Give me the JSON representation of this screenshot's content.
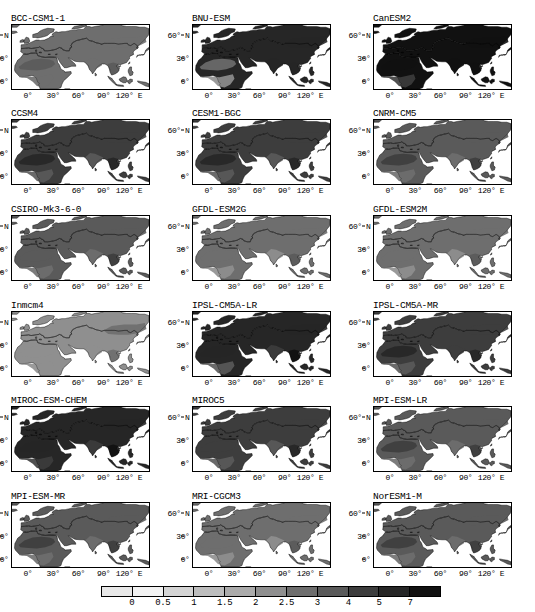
{
  "figure": {
    "type": "map-grid",
    "rows": 6,
    "cols": 3,
    "projection": "cylindrical-equidistant",
    "region": "Africa-Eurasia",
    "lon_range": [
      -20,
      145
    ],
    "lat_range": [
      -12,
      75
    ]
  },
  "axes": {
    "xticks": [
      {
        "label": "0°",
        "value": 0
      },
      {
        "label": "30°",
        "value": 30
      },
      {
        "label": "60°",
        "value": 60
      },
      {
        "label": "90°",
        "value": 90
      },
      {
        "label": "120° E",
        "value": 120
      }
    ],
    "yticks": [
      {
        "label": "60° N",
        "value": 60
      },
      {
        "label": "30°",
        "value": 30
      },
      {
        "label": "0°",
        "value": 0
      }
    ]
  },
  "colorbar": {
    "orientation": "horizontal",
    "labels": [
      "0",
      "0.5",
      "1",
      "1.5",
      "2",
      "2.5",
      "3",
      "4",
      "5",
      "7"
    ],
    "boundaries": [
      0,
      0.5,
      1,
      1.5,
      2,
      2.5,
      3,
      4,
      5,
      7
    ],
    "colors": [
      "#e8e8e8",
      "#f2f2f2",
      "#d4d4d4",
      "#bdbdbd",
      "#ababab",
      "#8f8f8f",
      "#6e6e6e",
      "#5a5a5a",
      "#3d3d3d",
      "#262626",
      "#111111"
    ]
  },
  "panels": [
    {
      "title": "BCC-CSM1-1",
      "level": 6,
      "land_level": 6,
      "sahara_level": 7,
      "india_level": 6,
      "seasia_level": 7,
      "ne_level": 6,
      "sahel_level": 6
    },
    {
      "title": "BNU-ESM",
      "level": 9,
      "land_level": 9,
      "sahara_level": 6,
      "india_level": 9,
      "seasia_level": 9,
      "ne_level": 9,
      "sahel_level": 5
    },
    {
      "title": "CanESM2",
      "level": 10,
      "land_level": 10,
      "sahara_level": 10,
      "india_level": 10,
      "seasia_level": 10,
      "ne_level": 10,
      "sahel_level": 8
    },
    {
      "title": "CCSM4",
      "level": 8,
      "land_level": 8,
      "sahara_level": 9,
      "india_level": 7,
      "seasia_level": 9,
      "ne_level": 8,
      "sahel_level": 7
    },
    {
      "title": "CESM1-BGC",
      "level": 8,
      "land_level": 8,
      "sahara_level": 9,
      "india_level": 7,
      "seasia_level": 9,
      "ne_level": 8,
      "sahel_level": 7
    },
    {
      "title": "CNRM-CM5",
      "level": 7,
      "land_level": 7,
      "sahara_level": 8,
      "india_level": 6,
      "seasia_level": 8,
      "ne_level": 7,
      "sahel_level": 6
    },
    {
      "title": "CSIRO-Mk3-6-0",
      "level": 7,
      "land_level": 7,
      "sahara_level": 7,
      "india_level": 6,
      "seasia_level": 8,
      "ne_level": 7,
      "sahel_level": 6
    },
    {
      "title": "GFDL-ESM2G",
      "level": 6,
      "land_level": 6,
      "sahara_level": 6,
      "india_level": 5,
      "seasia_level": 7,
      "ne_level": 6,
      "sahel_level": 5
    },
    {
      "title": "GFDL-ESM2M",
      "level": 6,
      "land_level": 6,
      "sahara_level": 6,
      "india_level": 5,
      "seasia_level": 7,
      "ne_level": 6,
      "sahel_level": 5
    },
    {
      "title": "Inmcm4",
      "level": 5,
      "land_level": 5,
      "sahara_level": 5,
      "india_level": 5,
      "seasia_level": 6,
      "ne_level": 6,
      "sahel_level": 5
    },
    {
      "title": "IPSL-CM5A-LR",
      "level": 9,
      "land_level": 9,
      "sahara_level": 9,
      "india_level": 8,
      "seasia_level": 10,
      "ne_level": 9,
      "sahel_level": 7
    },
    {
      "title": "IPSL-CM5A-MR",
      "level": 8,
      "land_level": 8,
      "sahara_level": 9,
      "india_level": 8,
      "seasia_level": 9,
      "ne_level": 8,
      "sahel_level": 7
    },
    {
      "title": "MIROC-ESM-CHEM",
      "level": 9,
      "land_level": 9,
      "sahara_level": 9,
      "india_level": 8,
      "seasia_level": 10,
      "ne_level": 9,
      "sahel_level": 8
    },
    {
      "title": "MIROC5",
      "level": 8,
      "land_level": 8,
      "sahara_level": 8,
      "india_level": 7,
      "seasia_level": 9,
      "ne_level": 8,
      "sahel_level": 7
    },
    {
      "title": "MPI-ESM-LR",
      "level": 7,
      "land_level": 7,
      "sahara_level": 8,
      "india_level": 6,
      "seasia_level": 8,
      "ne_level": 7,
      "sahel_level": 6
    },
    {
      "title": "MPI-ESM-MR",
      "level": 7,
      "land_level": 7,
      "sahara_level": 8,
      "india_level": 6,
      "seasia_level": 8,
      "ne_level": 7,
      "sahel_level": 6
    },
    {
      "title": "MRI-CGCM3",
      "level": 6,
      "land_level": 6,
      "sahara_level": 6,
      "india_level": 5,
      "seasia_level": 7,
      "ne_level": 6,
      "sahel_level": 5
    },
    {
      "title": "NorESM1-M",
      "level": 7,
      "land_level": 7,
      "sahara_level": 8,
      "india_level": 6,
      "seasia_level": 8,
      "ne_level": 7,
      "sahel_level": 6
    }
  ]
}
